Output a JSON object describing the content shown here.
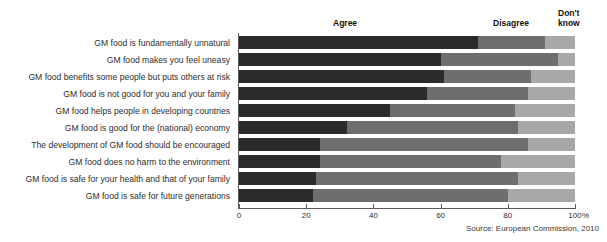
{
  "title_partial": "",
  "headers": {
    "agree": "Agree",
    "disagree": "Disagree",
    "dont_know": "Don't\nknow"
  },
  "source": "Source: European Commission, 2010",
  "axis_unit": "%",
  "colors": {
    "agree": "#2b2b2b",
    "disagree": "#6e6e6e",
    "dont_know": "#a8a8a8",
    "axis": "#5a5a5a",
    "background": "#ffffff",
    "text": "#2d2d2d"
  },
  "chart_data": {
    "type": "bar",
    "orientation": "horizontal",
    "stacked": true,
    "stacked_100": true,
    "title": "",
    "subtitle": "",
    "xlabel": "%",
    "ylabel": "",
    "xlim": [
      0,
      100
    ],
    "grid": false,
    "legend_position": "top",
    "tick_values": [
      0,
      20,
      40,
      60,
      80,
      100
    ],
    "tick_labels": [
      "0",
      "20",
      "40",
      "60",
      "80",
      "100"
    ],
    "legend": [
      "Agree",
      "Disagree",
      "Don't know"
    ],
    "categories": [
      "GM food is fundamentally unnatural",
      "GM food makes you feel uneasy",
      "GM food benefits some people but puts others at risk",
      "GM food is not good for you and your family",
      "GM food helps people in developing countries",
      "GM food is good for the (national) economy",
      "The development of GM food should be encouraged",
      "GM food does no harm to the environment",
      "GM food is safe for your health and that of your family",
      "GM food is safe for future generations"
    ],
    "series": [
      {
        "name": "Agree",
        "values": [
          71,
          60,
          61,
          56,
          45,
          32,
          24,
          24,
          23,
          22
        ]
      },
      {
        "name": "Disagree",
        "values": [
          20,
          35,
          26,
          30,
          37,
          51,
          62,
          54,
          60,
          58
        ]
      },
      {
        "name": "Don't know",
        "values": [
          9,
          5,
          13,
          14,
          18,
          17,
          14,
          22,
          17,
          20
        ]
      }
    ],
    "annotations": [
      "Source: European Commission, 2010"
    ]
  }
}
